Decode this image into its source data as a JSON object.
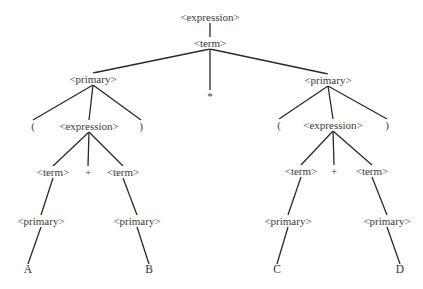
{
  "diagram": {
    "type": "parse-tree",
    "nodes": [
      {
        "id": "root",
        "label": "<expression>",
        "x": 210,
        "y": 17
      },
      {
        "id": "t0",
        "label": "<term>",
        "x": 210,
        "y": 43
      },
      {
        "id": "pL",
        "label": "<primary>",
        "x": 93,
        "y": 79
      },
      {
        "id": "star",
        "label": "*",
        "x": 210,
        "y": 96
      },
      {
        "id": "pR",
        "label": "<primary>",
        "x": 328,
        "y": 80
      },
      {
        "id": "lpL",
        "label": "(",
        "x": 33,
        "y": 126
      },
      {
        "id": "eL",
        "label": "<expression>",
        "x": 89,
        "y": 126
      },
      {
        "id": "rpL",
        "label": ")",
        "x": 141,
        "y": 126
      },
      {
        "id": "lpR",
        "label": "(",
        "x": 279,
        "y": 125
      },
      {
        "id": "eR",
        "label": "<expression>",
        "x": 333,
        "y": 125
      },
      {
        "id": "rpR",
        "label": ")",
        "x": 387,
        "y": 125
      },
      {
        "id": "tL1",
        "label": "<term>",
        "x": 53,
        "y": 172
      },
      {
        "id": "plusL",
        "label": "+",
        "x": 88,
        "y": 172
      },
      {
        "id": "tL2",
        "label": "<term>",
        "x": 123,
        "y": 172
      },
      {
        "id": "tR1",
        "label": "<term>",
        "x": 301,
        "y": 171
      },
      {
        "id": "plusR",
        "label": "+",
        "x": 334,
        "y": 171
      },
      {
        "id": "tR2",
        "label": "<term>",
        "x": 372,
        "y": 171
      },
      {
        "id": "pA",
        "label": "<primary>",
        "x": 41,
        "y": 221
      },
      {
        "id": "pB",
        "label": "<primary>",
        "x": 137,
        "y": 221
      },
      {
        "id": "pC",
        "label": "<primary>",
        "x": 288,
        "y": 221
      },
      {
        "id": "pD",
        "label": "<primary>",
        "x": 387,
        "y": 221
      },
      {
        "id": "A",
        "label": "A",
        "x": 28,
        "y": 270,
        "leaf": true
      },
      {
        "id": "B",
        "label": "B",
        "x": 149,
        "y": 270,
        "leaf": true
      },
      {
        "id": "C",
        "label": "C",
        "x": 277,
        "y": 270,
        "leaf": true
      },
      {
        "id": "D",
        "label": "D",
        "x": 400,
        "y": 270,
        "leaf": true
      }
    ],
    "edges": [
      [
        "root",
        "t0"
      ],
      [
        "t0",
        "pL"
      ],
      [
        "t0",
        "star"
      ],
      [
        "t0",
        "pR"
      ],
      [
        "pL",
        "lpL"
      ],
      [
        "pL",
        "eL"
      ],
      [
        "pL",
        "rpL"
      ],
      [
        "pR",
        "lpR"
      ],
      [
        "pR",
        "eR"
      ],
      [
        "pR",
        "rpR"
      ],
      [
        "eL",
        "tL1"
      ],
      [
        "eL",
        "plusL"
      ],
      [
        "eL",
        "tL2"
      ],
      [
        "eR",
        "tR1"
      ],
      [
        "eR",
        "plusR"
      ],
      [
        "eR",
        "tR2"
      ],
      [
        "tL1",
        "pA"
      ],
      [
        "tL2",
        "pB"
      ],
      [
        "tR1",
        "pC"
      ],
      [
        "tR2",
        "pD"
      ],
      [
        "pA",
        "A"
      ],
      [
        "pB",
        "B"
      ],
      [
        "pC",
        "C"
      ],
      [
        "pD",
        "D"
      ]
    ]
  }
}
